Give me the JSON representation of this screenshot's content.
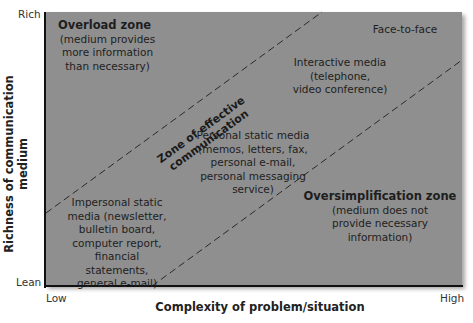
{
  "axes": {
    "y_label": "Richness of communication medium",
    "y_top": "Rich",
    "y_bottom": "Lean",
    "x_label": "Complexity of problem/situation",
    "x_left": "Low",
    "x_right": "High"
  },
  "zones": {
    "overload_title": "Overload zone",
    "overload_desc": [
      "(medium provides",
      "more information",
      "than necessary)"
    ],
    "effective_label": "Zone of effective communication",
    "oversimplification_title": "Oversimplification zone",
    "oversimplification_desc": [
      "(medium does not",
      "provide necessary",
      "information)"
    ]
  },
  "media": {
    "face_to_face": "Face-to-face",
    "interactive": [
      "Interactive media",
      "(telephone,",
      "video conference)"
    ],
    "personal_static": [
      "Personal static media",
      "(memos, letters, fax,",
      "personal e-mail,",
      "personal messaging",
      "service)"
    ],
    "impersonal_static": [
      "Impersonal static",
      "media (newsletter,",
      "bulletin board,",
      "computer report,",
      "financial statements,",
      "general e-mail)"
    ]
  },
  "colors": {
    "plot_bg": "#8f8f8f",
    "axis": "#111111",
    "dash": "#2a2a2a"
  }
}
